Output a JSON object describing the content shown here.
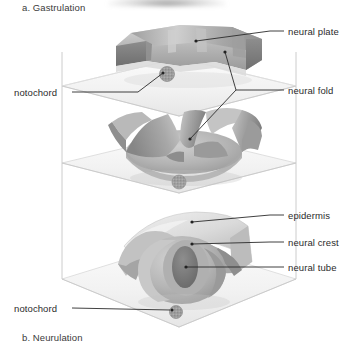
{
  "figure": {
    "title_top": "a. Gastrulation",
    "title_bottom": "b. Neurulation",
    "background_color": "#ffffff",
    "line_color": "#2b2b2b",
    "arrow_fill": "#f2f2f2",
    "arrow_stroke": "#d2d2d2",
    "tissue_light": "#e8e8e8",
    "tissue_mid": "#bdbdbd",
    "tissue_dark": "#8f8f8f",
    "tissue_darkest": "#6e6e6e"
  },
  "labels": {
    "neural_plate": "neural plate",
    "neural_fold": "neural fold",
    "notochord_top": "notochord",
    "epidermis": "epidermis",
    "neural_crest": "neural crest",
    "neural_tube": "neural tube",
    "notochord_bottom": "notochord"
  },
  "stages": [
    {
      "name": "neural-plate-stage",
      "order": 1,
      "structures": [
        "neural plate",
        "neural fold",
        "notochord"
      ]
    },
    {
      "name": "neural-fold-stage",
      "order": 2,
      "structures": [
        "neural fold",
        "notochord"
      ]
    },
    {
      "name": "neural-tube-stage",
      "order": 3,
      "structures": [
        "epidermis",
        "neural crest",
        "neural tube",
        "notochord"
      ]
    }
  ]
}
